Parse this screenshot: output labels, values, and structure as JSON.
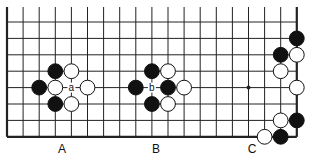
{
  "diagram": {
    "type": "go-board-fragment",
    "colors": {
      "line": "#222222",
      "black_stone": "#111111",
      "white_stone": "#ffffff",
      "background": "#ffffff"
    },
    "grid": {
      "x0": 7,
      "y0": 22,
      "spacing_x": 16.1,
      "spacing_y": 16.4,
      "cols": 19,
      "rows": 8,
      "top_open": true,
      "left_edge": true,
      "right_edge": true,
      "bottom_edge": true
    },
    "stones": [
      {
        "color": "black",
        "col": 3,
        "row": 3
      },
      {
        "color": "white",
        "col": 4,
        "row": 3
      },
      {
        "color": "black",
        "col": 2,
        "row": 4
      },
      {
        "color": "white",
        "col": 3,
        "row": 4
      },
      {
        "color": "white",
        "col": 5,
        "row": 4
      },
      {
        "color": "black",
        "col": 3,
        "row": 5
      },
      {
        "color": "white",
        "col": 4,
        "row": 5
      },
      {
        "color": "black",
        "col": 9,
        "row": 3
      },
      {
        "color": "white",
        "col": 10,
        "row": 3
      },
      {
        "color": "black",
        "col": 8,
        "row": 4
      },
      {
        "color": "black",
        "col": 10,
        "row": 4
      },
      {
        "color": "white",
        "col": 11,
        "row": 4
      },
      {
        "color": "black",
        "col": 9,
        "row": 5
      },
      {
        "color": "white",
        "col": 10,
        "row": 5
      },
      {
        "color": "black",
        "col": 18,
        "row": 1
      },
      {
        "color": "black",
        "col": 17,
        "row": 2
      },
      {
        "color": "white",
        "col": 18,
        "row": 2
      },
      {
        "color": "white",
        "col": 17,
        "row": 3
      },
      {
        "color": "white",
        "col": 18,
        "row": 4
      },
      {
        "color": "white",
        "col": 17,
        "row": 6
      },
      {
        "color": "black",
        "col": 18,
        "row": 6
      },
      {
        "color": "white",
        "col": 16,
        "row": 7
      },
      {
        "color": "black",
        "col": 17,
        "row": 7
      }
    ],
    "star_points": [
      {
        "col": 15,
        "row": 4
      }
    ],
    "point_labels": [
      {
        "text": "a",
        "col": 4,
        "row": 4
      },
      {
        "text": "b",
        "col": 9,
        "row": 4
      }
    ],
    "captions": [
      {
        "text": "A",
        "x": 62,
        "y": 149
      },
      {
        "text": "B",
        "x": 156,
        "y": 149
      },
      {
        "text": "C",
        "x": 252,
        "y": 149
      }
    ]
  }
}
